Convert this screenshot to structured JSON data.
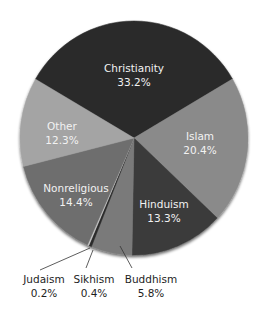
{
  "chart_data": {
    "type": "pie",
    "title": "",
    "start_angle_deg": -59.8,
    "direction": "clockwise",
    "slices": [
      {
        "label": "Christianity",
        "value": 33.2,
        "display": "33.2%",
        "color": "#2b2b2b",
        "label_pos": "inside"
      },
      {
        "label": "Islam",
        "value": 20.4,
        "display": "20.4%",
        "color": "#8a8a8a",
        "label_pos": "inside"
      },
      {
        "label": "Hinduism",
        "value": 13.3,
        "display": "13.3%",
        "color": "#3a3a3a",
        "label_pos": "inside"
      },
      {
        "label": "Buddhism",
        "value": 5.8,
        "display": "5.8%",
        "color": "#7a7a7a",
        "label_pos": "outside"
      },
      {
        "label": "Sikhism",
        "value": 0.4,
        "display": "0.4%",
        "color": "#2a2a2a",
        "label_pos": "outside"
      },
      {
        "label": "Judaism",
        "value": 0.2,
        "display": "0.2%",
        "color": "#c8c8c8",
        "label_pos": "outside"
      },
      {
        "label": "Nonreligious",
        "value": 14.4,
        "display": "14.4%",
        "color": "#6e6e6e",
        "label_pos": "inside"
      },
      {
        "label": "Other",
        "value": 12.3,
        "display": "12.3%",
        "color": "#a4a4a4",
        "label_pos": "inside"
      }
    ]
  },
  "labels": {
    "christianity": {
      "name": "Christianity",
      "pct": "33.2%"
    },
    "islam": {
      "name": "Islam",
      "pct": "20.4%"
    },
    "hinduism": {
      "name": "Hinduism",
      "pct": "13.3%"
    },
    "buddhism": {
      "name": "Buddhism",
      "pct": "5.8%"
    },
    "sikhism": {
      "name": "Sikhism",
      "pct": "0.4%"
    },
    "judaism": {
      "name": "Judaism",
      "pct": "0.2%"
    },
    "nonreligious": {
      "name": "Nonreligious",
      "pct": "14.4%"
    },
    "other": {
      "name": "Other",
      "pct": "12.3%"
    }
  }
}
